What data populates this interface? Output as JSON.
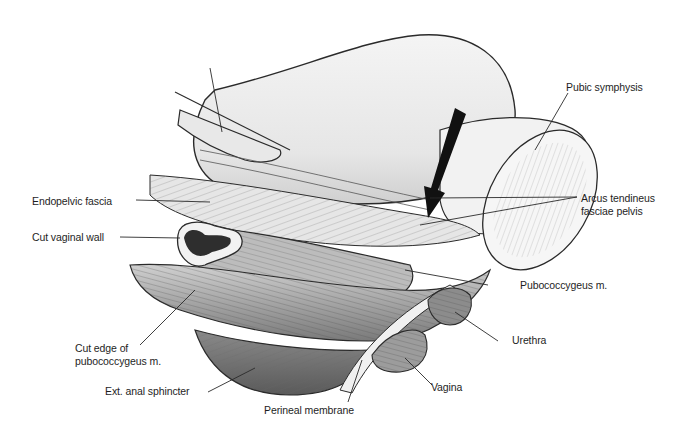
{
  "figure": {
    "type": "anatomical illustration",
    "colors": {
      "background": "#ffffff",
      "line": "#2a2a2a",
      "shading_light": "#ececec",
      "shading_mid": "#bdbdbd",
      "shading_dark": "#5a5a5a",
      "arrow": "#111111"
    }
  },
  "labels": {
    "pubic_symphysis": "Pubic symphysis",
    "endopelvic_fascia": "Endopelvic fascia",
    "arcus_tendineus_line1": "Arcus tendineus",
    "arcus_tendineus_line2": "fasciae pelvis",
    "cut_vaginal_wall": "Cut vaginal wall",
    "pubococcygeus": "Pubococcygeus m.",
    "cut_edge_line1": "Cut edge of",
    "cut_edge_line2": "pubococcygeus m.",
    "urethra": "Urethra",
    "ext_anal_sphincter": "Ext. anal sphincter",
    "vagina": "Vagina",
    "perineal_membrane": "Perineal membrane"
  },
  "annotations": {
    "arrow": "black arrow pointing to arcus tendineus fasciae pelvis"
  }
}
